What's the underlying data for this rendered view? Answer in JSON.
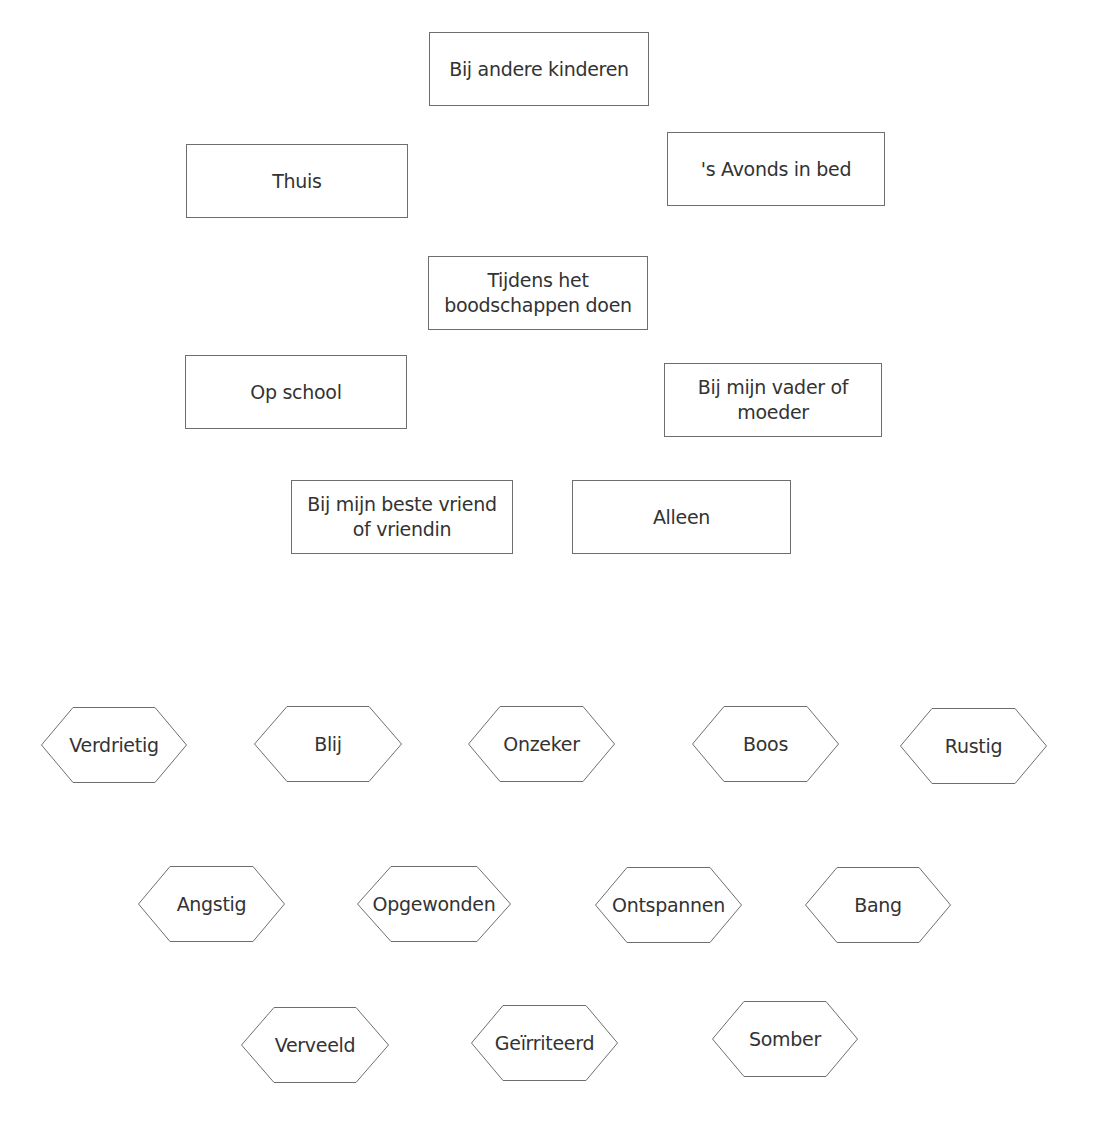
{
  "places": [
    {
      "id": "bij-andere-kinderen",
      "label": "Bij andere kinderen",
      "x": 429,
      "y": 32,
      "w": 220,
      "h": 74
    },
    {
      "id": "thuis",
      "label": "Thuis",
      "x": 186,
      "y": 144,
      "w": 222,
      "h": 74
    },
    {
      "id": "avonds-in-bed",
      "label": "'s Avonds in bed",
      "x": 667,
      "y": 132,
      "w": 218,
      "h": 74
    },
    {
      "id": "boodschappen-doen",
      "label": "Tijdens het boodschappen doen",
      "x": 428,
      "y": 256,
      "w": 220,
      "h": 74
    },
    {
      "id": "op-school",
      "label": "Op school",
      "x": 185,
      "y": 355,
      "w": 222,
      "h": 74
    },
    {
      "id": "vader-of-moeder",
      "label": "Bij mijn vader of moeder",
      "x": 664,
      "y": 363,
      "w": 218,
      "h": 74
    },
    {
      "id": "beste-vriend",
      "label": "Bij mijn beste vriend of vriendin",
      "x": 291,
      "y": 480,
      "w": 222,
      "h": 74
    },
    {
      "id": "alleen",
      "label": "Alleen",
      "x": 572,
      "y": 480,
      "w": 219,
      "h": 74
    }
  ],
  "emotions": [
    {
      "id": "verdrietig",
      "label": "Verdrietig",
      "x": 41,
      "y": 707,
      "w": 146,
      "h": 76
    },
    {
      "id": "blij",
      "label": "Blij",
      "x": 254,
      "y": 706,
      "w": 148,
      "h": 76
    },
    {
      "id": "onzeker",
      "label": "Onzeker",
      "x": 468,
      "y": 706,
      "w": 147,
      "h": 76
    },
    {
      "id": "boos",
      "label": "Boos",
      "x": 692,
      "y": 706,
      "w": 147,
      "h": 76
    },
    {
      "id": "rustig",
      "label": "Rustig",
      "x": 900,
      "y": 708,
      "w": 147,
      "h": 76
    },
    {
      "id": "angstig",
      "label": "Angstig",
      "x": 138,
      "y": 866,
      "w": 147,
      "h": 76
    },
    {
      "id": "opgewonden",
      "label": "Opgewonden",
      "x": 357,
      "y": 866,
      "w": 154,
      "h": 76
    },
    {
      "id": "ontspannen",
      "label": "Ontspannen",
      "x": 595,
      "y": 867,
      "w": 147,
      "h": 76
    },
    {
      "id": "bang",
      "label": "Bang",
      "x": 805,
      "y": 867,
      "w": 146,
      "h": 76
    },
    {
      "id": "verveeld",
      "label": "Verveeld",
      "x": 241,
      "y": 1007,
      "w": 148,
      "h": 76
    },
    {
      "id": "geirriteerd",
      "label": "Geïrriteerd",
      "x": 471,
      "y": 1005,
      "w": 147,
      "h": 76
    },
    {
      "id": "somber",
      "label": "Somber",
      "x": 712,
      "y": 1001,
      "w": 146,
      "h": 76
    }
  ],
  "colors": {
    "border": "#6e6e6e",
    "text": "#333333",
    "background": "#ffffff"
  }
}
